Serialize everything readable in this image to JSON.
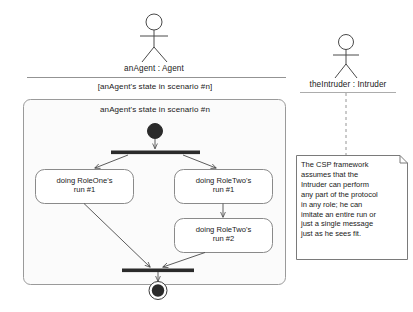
{
  "diagram": {
    "kind": "uml-activity-diagram",
    "stroke_color": "#3a3a3a",
    "fill_color": "#ffffff",
    "lane_fill": "#fbfbfb",
    "note_fill": "#ffffff"
  },
  "actors": {
    "agent": {
      "icon": "actor-stick-figure-icon",
      "label": "anAgent : Agent"
    },
    "intruder": {
      "icon": "actor-stick-figure-icon",
      "label": "theIntruder : Intruder"
    }
  },
  "guard": {
    "label": "[anAgent's state in scenario #n]"
  },
  "lane": {
    "title": "anAgent's state in scenario #n"
  },
  "nodes": {
    "initial": {
      "name": "initial-node"
    },
    "fork": {
      "name": "fork-bar"
    },
    "join": {
      "name": "join-bar"
    },
    "final": {
      "name": "final-node"
    }
  },
  "activities": [
    {
      "id": "role-one-run-1",
      "line1": "doing RoleOne's",
      "line2": "run #1"
    },
    {
      "id": "role-two-run-1",
      "line1": "doing RoleTwo's",
      "line2": "run #1"
    },
    {
      "id": "role-two-run-2",
      "line1": "doing RoleTwo's",
      "line2": "run #2"
    }
  ],
  "note": {
    "text": "The CSP framework\nassumes that the\nIntruder can perform\nany part of the protocol\nin any role; he can\nimitate an entire run or\njust a single message\njust as he sees fit."
  }
}
